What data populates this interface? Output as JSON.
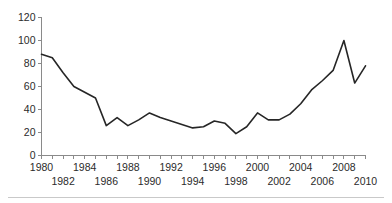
{
  "chart_data": {
    "type": "line",
    "title": "",
    "subtitle": "",
    "xlabel": "",
    "ylabel": "",
    "xlim": [
      1980,
      2010
    ],
    "ylim": [
      0,
      120
    ],
    "grid": false,
    "legend": null,
    "y_ticks": [
      0,
      20,
      40,
      60,
      80,
      100,
      120
    ],
    "y_tick_labels": [
      "0",
      "20",
      "40",
      "60",
      "80",
      "100",
      "120"
    ],
    "x_ticks": [
      1980,
      1981,
      1982,
      1983,
      1984,
      1985,
      1986,
      1987,
      1988,
      1989,
      1990,
      1991,
      1992,
      1993,
      1994,
      1995,
      1996,
      1997,
      1998,
      1999,
      2000,
      2001,
      2002,
      2003,
      2004,
      2005,
      2006,
      2007,
      2008,
      2009,
      2010
    ],
    "x_tick_labels_row1": [
      "1980",
      "1984",
      "1988",
      "1992",
      "1996",
      "2000",
      "2004",
      "2008"
    ],
    "x_tick_labels_row1_values": [
      1980,
      1984,
      1988,
      1992,
      1996,
      2000,
      2004,
      2008
    ],
    "x_tick_labels_row2": [
      "1982",
      "1986",
      "1990",
      "1994",
      "1998",
      "2002",
      "2006",
      "2010"
    ],
    "x_tick_labels_row2_values": [
      1982,
      1986,
      1990,
      1994,
      1998,
      2002,
      2006,
      2010
    ],
    "x": [
      1980,
      1981,
      1982,
      1983,
      1984,
      1985,
      1986,
      1987,
      1988,
      1989,
      1990,
      1991,
      1992,
      1993,
      1994,
      1995,
      1996,
      1997,
      1998,
      1999,
      2000,
      2001,
      2002,
      2003,
      2004,
      2005,
      2006,
      2007,
      2008,
      2009,
      2010
    ],
    "values": [
      88,
      85,
      72,
      60,
      55,
      50,
      26,
      33,
      26,
      31,
      37,
      33,
      30,
      27,
      24,
      25,
      30,
      28,
      19,
      25,
      37,
      31,
      31,
      36,
      45,
      57,
      65,
      74,
      100,
      63,
      78
    ],
    "series": [
      {
        "name": "series-1",
        "color": "#262626",
        "values": [
          88,
          85,
          72,
          60,
          55,
          50,
          26,
          33,
          26,
          31,
          37,
          33,
          30,
          27,
          24,
          25,
          30,
          28,
          19,
          25,
          37,
          31,
          31,
          36,
          45,
          57,
          65,
          74,
          100,
          63,
          78
        ]
      }
    ]
  },
  "style": {
    "line_color": "#262626",
    "axis_color": "#8a8a8a",
    "label_color": "#2b2b2b",
    "rule_color": "#c9c9c9",
    "background": "#ffffff"
  },
  "footer": {
    "rule_present": true
  }
}
